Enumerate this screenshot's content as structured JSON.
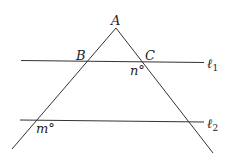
{
  "diagram": {
    "labels": {
      "A": "A",
      "B": "B",
      "C": "C",
      "n": "n°",
      "m": "m°",
      "l1": "ℓ",
      "l1_sub": "1",
      "l2": "ℓ",
      "l2_sub": "2"
    }
  }
}
